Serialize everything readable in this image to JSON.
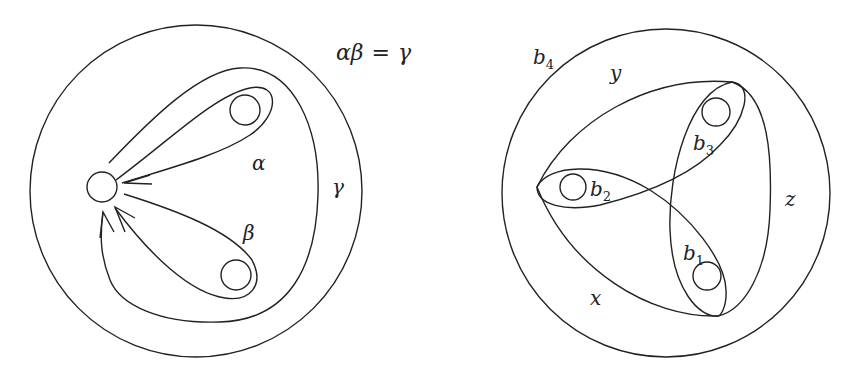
{
  "equation": {
    "left_a": "α",
    "left_b": "β",
    "equals": "=",
    "right": "γ"
  },
  "left_diagram": {
    "labels": {
      "alpha": "α",
      "beta": "β",
      "gamma": "γ"
    }
  },
  "right_diagram": {
    "labels": {
      "b1": "b",
      "b1_sub": "1",
      "b2": "b",
      "b2_sub": "2",
      "b3": "b",
      "b3_sub": "3",
      "b4": "b",
      "b4_sub": "4",
      "x": "x",
      "y": "y",
      "z": "z"
    }
  },
  "colors": {
    "stroke": "#222222",
    "background": "#ffffff"
  }
}
